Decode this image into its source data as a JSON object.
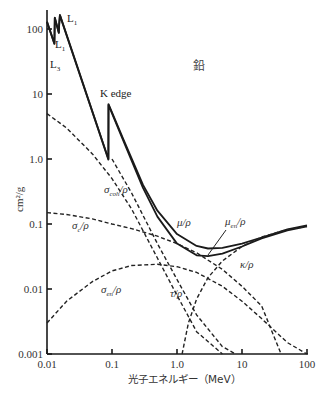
{
  "chart_data": {
    "type": "line",
    "title": "鉛",
    "xlabel": "光子エネルギー（MeV）",
    "ylabel": "cm²/g",
    "xscale": "log",
    "yscale": "log",
    "xlim": [
      0.01,
      100
    ],
    "ylim": [
      0.001,
      200
    ],
    "x_ticks": [
      "0.01",
      "0.1",
      "1.0",
      "10",
      "100"
    ],
    "y_ticks": [
      "0.001",
      "0.01",
      "0.1",
      "1.0",
      "10",
      "100"
    ],
    "grid": false,
    "annotations": [
      {
        "text": "L",
        "sub": "1",
        "x": 0.016,
        "y": 150
      },
      {
        "text": "L",
        "sub": "1",
        "x": 0.0155,
        "y": 60
      },
      {
        "text": "L",
        "sub": "3",
        "x": 0.0105,
        "y": 22
      },
      {
        "text": "K edge",
        "x": 0.088,
        "y": 11
      }
    ],
    "series": [
      {
        "name": "μ/ρ",
        "label": "μ/ρ",
        "style": "solid",
        "points": [
          [
            0.01,
            130
          ],
          [
            0.013,
            60
          ],
          [
            0.0132,
            150
          ],
          [
            0.0152,
            88
          ],
          [
            0.0154,
            120
          ],
          [
            0.0158,
            165
          ],
          [
            0.088,
            1.0
          ],
          [
            0.0882,
            7.0
          ],
          [
            0.15,
            2.0
          ],
          [
            0.3,
            0.4
          ],
          [
            0.5,
            0.16
          ],
          [
            1,
            0.07
          ],
          [
            2,
            0.046
          ],
          [
            3,
            0.042
          ],
          [
            5,
            0.043
          ],
          [
            10,
            0.05
          ],
          [
            20,
            0.062
          ],
          [
            50,
            0.083
          ],
          [
            100,
            0.095
          ]
        ]
      },
      {
        "name": "μen/ρ",
        "label": "μ_en/ρ",
        "style": "solid",
        "points": [
          [
            0.01,
            128
          ],
          [
            0.013,
            59
          ],
          [
            0.0132,
            148
          ],
          [
            0.0152,
            87
          ],
          [
            0.0154,
            118
          ],
          [
            0.0158,
            162
          ],
          [
            0.088,
            0.98
          ],
          [
            0.0882,
            6.8
          ],
          [
            0.15,
            1.9
          ],
          [
            0.3,
            0.36
          ],
          [
            0.5,
            0.13
          ],
          [
            1,
            0.05
          ],
          [
            2,
            0.033
          ],
          [
            3,
            0.032
          ],
          [
            5,
            0.035
          ],
          [
            10,
            0.045
          ],
          [
            20,
            0.06
          ],
          [
            50,
            0.08
          ],
          [
            100,
            0.092
          ]
        ]
      },
      {
        "name": "σcoh/ρ",
        "label": "σ_coh/ρ",
        "style": "dashed",
        "points": [
          [
            0.01,
            5
          ],
          [
            0.02,
            3
          ],
          [
            0.05,
            1.2
          ],
          [
            0.1,
            0.5
          ],
          [
            0.2,
            0.17
          ],
          [
            0.5,
            0.03
          ],
          [
            1,
            0.008
          ],
          [
            2,
            0.0022
          ],
          [
            5,
            0.0005
          ]
        ]
      },
      {
        "name": "σc/ρ",
        "label": "σ_c/ρ",
        "style": "dashed",
        "points": [
          [
            0.01,
            0.15
          ],
          [
            0.02,
            0.14
          ],
          [
            0.05,
            0.12
          ],
          [
            0.1,
            0.1
          ],
          [
            0.2,
            0.085
          ],
          [
            0.5,
            0.065
          ],
          [
            1,
            0.05
          ],
          [
            2,
            0.036
          ],
          [
            5,
            0.02
          ],
          [
            10,
            0.011
          ],
          [
            20,
            0.0055
          ],
          [
            40,
            0.001
          ]
        ]
      },
      {
        "name": "σen/ρ",
        "label": "σ_en/ρ",
        "style": "dashed",
        "points": [
          [
            0.01,
            0.003
          ],
          [
            0.02,
            0.0065
          ],
          [
            0.05,
            0.013
          ],
          [
            0.1,
            0.019
          ],
          [
            0.2,
            0.023
          ],
          [
            0.5,
            0.024
          ],
          [
            1,
            0.022
          ],
          [
            2,
            0.018
          ],
          [
            5,
            0.011
          ],
          [
            10,
            0.0065
          ],
          [
            20,
            0.0035
          ],
          [
            50,
            0.0015
          ],
          [
            100,
            0.0009
          ]
        ]
      },
      {
        "name": "τ/ρ",
        "label": "τ/ρ",
        "style": "dashed",
        "points": [
          [
            0.1,
            1.0
          ],
          [
            0.2,
            0.3
          ],
          [
            0.5,
            0.05
          ],
          [
            1,
            0.014
          ],
          [
            2,
            0.004
          ],
          [
            5,
            0.0013
          ],
          [
            8,
            0.001
          ]
        ]
      },
      {
        "name": "κ/ρ",
        "label": "κ/ρ",
        "style": "dashed",
        "points": [
          [
            1.2,
            0.001
          ],
          [
            1.5,
            0.003
          ],
          [
            2,
            0.007
          ],
          [
            3,
            0.015
          ],
          [
            5,
            0.027
          ],
          [
            10,
            0.045
          ],
          [
            20,
            0.063
          ],
          [
            50,
            0.082
          ],
          [
            100,
            0.092
          ]
        ]
      }
    ]
  },
  "labels": {
    "title": "鉛",
    "xlabel": "光子エネルギー（MeV）",
    "ylabel": "cm²/g",
    "k_edge": "K edge",
    "L": "L",
    "L1_sub": "1",
    "L3_sub": "3",
    "mu": "μ/ρ",
    "mu_en_main": "μ",
    "mu_en_sub": "en",
    "mu_en_tail": "/ρ",
    "sigma": "σ",
    "coh_sub": "coh",
    "c_sub": "c",
    "en_sub": "en",
    "rho_tail": "/ρ",
    "tau": "τ/ρ",
    "kappa": "κ/ρ"
  }
}
